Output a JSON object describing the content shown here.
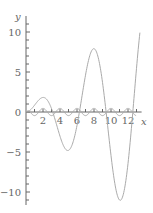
{
  "chart_data": {
    "type": "line",
    "title": "",
    "xlabel": "x",
    "ylabel": "y",
    "xlim": [
      0,
      13.5
    ],
    "ylim": [
      -12,
      11.5
    ],
    "x_ticks": [
      2,
      4,
      6,
      8,
      10,
      12
    ],
    "y_ticks": [
      -10,
      -5,
      0,
      5,
      10
    ],
    "x_tick_labels": [
      "2",
      "4",
      "6",
      "8",
      "10",
      "12"
    ],
    "y_tick_labels": [
      "-10",
      "-5",
      "0",
      "5",
      "10"
    ],
    "grid": false,
    "legend": null,
    "series": [
      {
        "name": "y = x·sin(x)",
        "color": "#aaaaaa",
        "x": [
          0,
          1,
          2,
          3,
          4,
          4.9,
          6,
          7,
          7.98,
          9,
          10,
          11.09,
          12,
          13,
          13.5
        ],
        "values": [
          0,
          0.84,
          1.82,
          0.42,
          -3.03,
          -4.81,
          -1.68,
          4.6,
          7.92,
          3.71,
          -5.44,
          -11.05,
          -6.44,
          5.46,
          10.5
        ]
      },
      {
        "name": "small oscillation",
        "color": "#aaaaaa",
        "x": [
          0,
          1,
          2,
          3,
          4,
          5,
          6,
          7,
          8,
          9,
          10,
          11,
          12,
          13
        ],
        "values": [
          0,
          -0.3,
          0.5,
          -0.3,
          0.5,
          -0.3,
          0.3,
          -0.3,
          0.5,
          -0.3,
          0.5,
          -0.3,
          0.3,
          0
        ]
      }
    ]
  }
}
